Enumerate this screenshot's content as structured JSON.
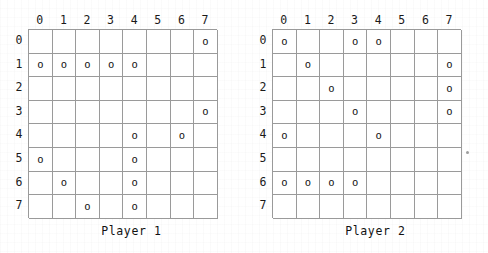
{
  "boards": [
    {
      "id": "player-1",
      "label": "Player 1",
      "col_headers": [
        "0",
        "1",
        "2",
        "3",
        "4",
        "5",
        "6",
        "7"
      ],
      "row_headers": [
        "0",
        "1",
        "2",
        "3",
        "4",
        "5",
        "6",
        "7"
      ],
      "mark_glyph": "o",
      "cells": [
        [
          "",
          "",
          "",
          "",
          "",
          "",
          "",
          "o"
        ],
        [
          "o",
          "o",
          "o",
          "o",
          "o",
          "",
          "",
          ""
        ],
        [
          "",
          "",
          "",
          "",
          "",
          "",
          "",
          ""
        ],
        [
          "",
          "",
          "",
          "",
          "",
          "",
          "",
          "o"
        ],
        [
          "",
          "",
          "",
          "",
          "o",
          "",
          "o",
          ""
        ],
        [
          "o",
          "",
          "",
          "",
          "o",
          "",
          "",
          ""
        ],
        [
          "",
          "o",
          "",
          "",
          "o",
          "",
          "",
          ""
        ],
        [
          "",
          "",
          "o",
          "",
          "o",
          "",
          "",
          ""
        ]
      ]
    },
    {
      "id": "player-2",
      "label": "Player 2",
      "col_headers": [
        "0",
        "1",
        "2",
        "3",
        "4",
        "5",
        "6",
        "7"
      ],
      "row_headers": [
        "0",
        "1",
        "2",
        "3",
        "4",
        "5",
        "6",
        "7"
      ],
      "mark_glyph": "o",
      "cells": [
        [
          "o",
          "",
          "",
          "o",
          "o",
          "",
          "",
          ""
        ],
        [
          "",
          "o",
          "",
          "",
          "",
          "",
          "",
          "o"
        ],
        [
          "",
          "",
          "o",
          "",
          "",
          "",
          "",
          "o"
        ],
        [
          "",
          "",
          "",
          "o",
          "",
          "",
          "",
          "o"
        ],
        [
          "o",
          "",
          "",
          "",
          "o",
          "",
          "",
          ""
        ],
        [
          "",
          "",
          "",
          "",
          "",
          "",
          "",
          ""
        ],
        [
          "o",
          "o",
          "o",
          "o",
          "",
          "",
          "",
          ""
        ],
        [
          "",
          "",
          "",
          "",
          "",
          "",
          "",
          ""
        ]
      ]
    }
  ],
  "colors": {
    "grid_line": "#9a9a9a",
    "text": "#111111",
    "background": "#ffffff"
  }
}
